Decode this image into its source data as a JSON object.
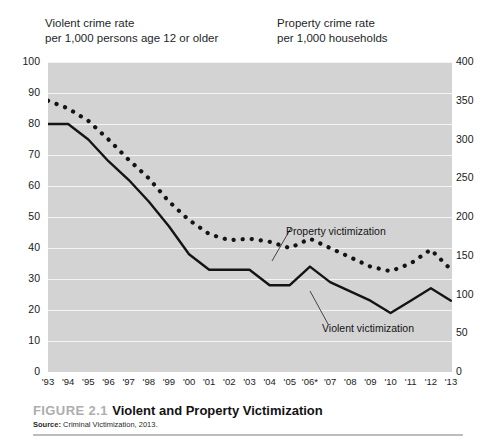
{
  "headers": {
    "left_line1": "Violent crime rate",
    "left_line2": "per 1,000 persons age 12 or older",
    "right_line1": "Property crime rate",
    "right_line2": "per 1,000 households"
  },
  "caption": {
    "figure_number": "FIGURE 2.1",
    "title": "Violent and Property Victimization",
    "source_label": "Source:",
    "source_text": "Criminal Victimization, 2013."
  },
  "annotations": {
    "property_label": "Property victimization",
    "violent_label": "Violent victimization"
  },
  "colors": {
    "plot_background": "#d3d3d3",
    "gridline": "#f4f4f4",
    "series": "#141414",
    "page_background": "#ffffff",
    "figure_number": "#adadad",
    "caption_rule": "#bdbdbd"
  },
  "chart_data": {
    "type": "line",
    "title": "Violent and Property Victimization",
    "xlabel": "",
    "ylabel": "Violent crime rate per 1,000 persons age 12 or older",
    "y2label": "Property crime rate per 1,000 households",
    "grid": true,
    "legend": "inline-annotations",
    "x": [
      "'93",
      "'94",
      "'95",
      "'96",
      "'97",
      "'98",
      "'99",
      "'00",
      "'01",
      "'02",
      "'03",
      "'04",
      "'05",
      "'06*",
      "'07",
      "'08",
      "'09",
      "'10",
      "'11",
      "'12",
      "'13"
    ],
    "ylim": [
      0,
      100
    ],
    "yticks": [
      0,
      10,
      20,
      30,
      40,
      50,
      60,
      70,
      80,
      90,
      100
    ],
    "y2lim": [
      0,
      400
    ],
    "y2ticks": [
      0,
      50,
      100,
      150,
      200,
      250,
      300,
      350,
      400
    ],
    "series": [
      {
        "name": "Violent victimization",
        "axis": "left",
        "style": "solid",
        "values": [
          80,
          80,
          75,
          68,
          62,
          55,
          47,
          38,
          33,
          33,
          33,
          28,
          28,
          34,
          29,
          26,
          23,
          19,
          23,
          27,
          23
        ]
      },
      {
        "name": "Property victimization",
        "axis": "right",
        "style": "dotted",
        "values": [
          350,
          340,
          325,
          300,
          275,
          250,
          220,
          195,
          178,
          170,
          172,
          168,
          160,
          172,
          160,
          148,
          135,
          130,
          140,
          158,
          132
        ],
        "values_left_scale": [
          87.5,
          85,
          81,
          75,
          68.5,
          62.5,
          55,
          49,
          44.5,
          42.5,
          43,
          42,
          40,
          43,
          40,
          37,
          34,
          32.5,
          35,
          39.5,
          33
        ]
      }
    ],
    "footnote_marker": "*"
  }
}
